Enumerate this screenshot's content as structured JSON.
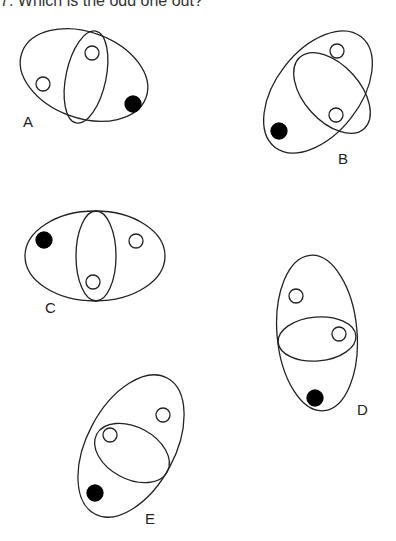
{
  "title": "7. Which is the odd one out?",
  "figures": [
    {
      "label": "A"
    },
    {
      "label": "B"
    },
    {
      "label": "C"
    },
    {
      "label": "D"
    },
    {
      "label": "E"
    }
  ],
  "colors": {
    "stroke": "#222222",
    "filled": "#000000",
    "hollow": "#ffffff"
  }
}
